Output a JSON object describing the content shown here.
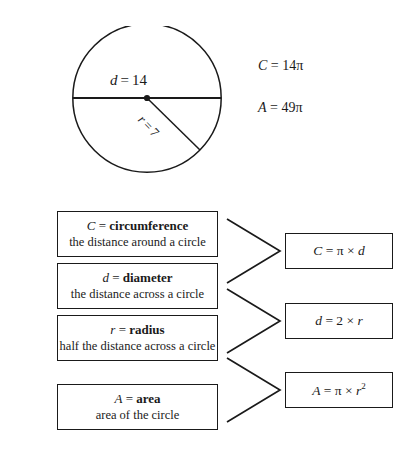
{
  "diagram": {
    "name": "circle-with-diameter-and-radius",
    "diameter_label": "d = 14",
    "radius_label": "r = 7",
    "diameter_value": 14,
    "radius_value": 7,
    "center_dot": true
  },
  "given_values": {
    "circumference": "C = 14π",
    "area": "A = 49π"
  },
  "definitions": [
    {
      "symbol": "C",
      "term": "circumference",
      "term_line": "C = circumference",
      "description": "the distance around a circle"
    },
    {
      "symbol": "d",
      "term": "diameter",
      "term_line": "d = diameter",
      "description": "the distance across a circle"
    },
    {
      "symbol": "r",
      "term": "radius",
      "term_line": "r = radius",
      "description": "half the distance across a circle"
    },
    {
      "symbol": "A",
      "term": "area",
      "term_line": "A = area",
      "description": "area of the circle"
    }
  ],
  "formulas": [
    {
      "text": "C = π × d",
      "result": "C",
      "expression": "π × d"
    },
    {
      "text": "d = 2 × r",
      "result": "d",
      "expression": "2 × r"
    },
    {
      "text": "A = π × r²",
      "result": "A",
      "expression": "π × r²"
    }
  ],
  "colors": {
    "background": "#ffffff",
    "ink": "#1a1a1a",
    "border": "#1a1a1a"
  }
}
